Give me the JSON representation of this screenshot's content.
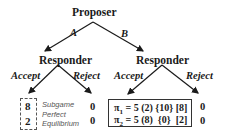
{
  "tree": {
    "root": {
      "player": "Proposer"
    },
    "root_actions": [
      {
        "label": "A"
      },
      {
        "label": "B"
      }
    ],
    "responder_nodes": [
      {
        "player": "Responder",
        "actions": [
          {
            "label": "Accept"
          },
          {
            "label": "Reject"
          }
        ]
      },
      {
        "player": "Responder",
        "actions": [
          {
            "label": "Accept"
          },
          {
            "label": "Reject"
          }
        ]
      }
    ]
  },
  "payoffs": {
    "A_accept": {
      "p1": "8",
      "p2": "2"
    },
    "A_reject": {
      "p1": "0",
      "p2": "0"
    },
    "B_accept": {
      "p1_label": "π",
      "p1_sub": "1",
      "p1_values": "= 5 (2) {10} [8]",
      "p2_label": "π",
      "p2_sub": "2",
      "p2_values": "= 5 (8)  {0}  [2]"
    },
    "B_reject": {
      "p1": "0",
      "p2": "0"
    }
  },
  "annotation": {
    "line1": "Subgame",
    "line2": "Perfect",
    "line3": "Equilibrium"
  },
  "colors": {
    "ink": "#1a1a1a",
    "annotation": "#555555",
    "dashed_border": "#555555"
  }
}
